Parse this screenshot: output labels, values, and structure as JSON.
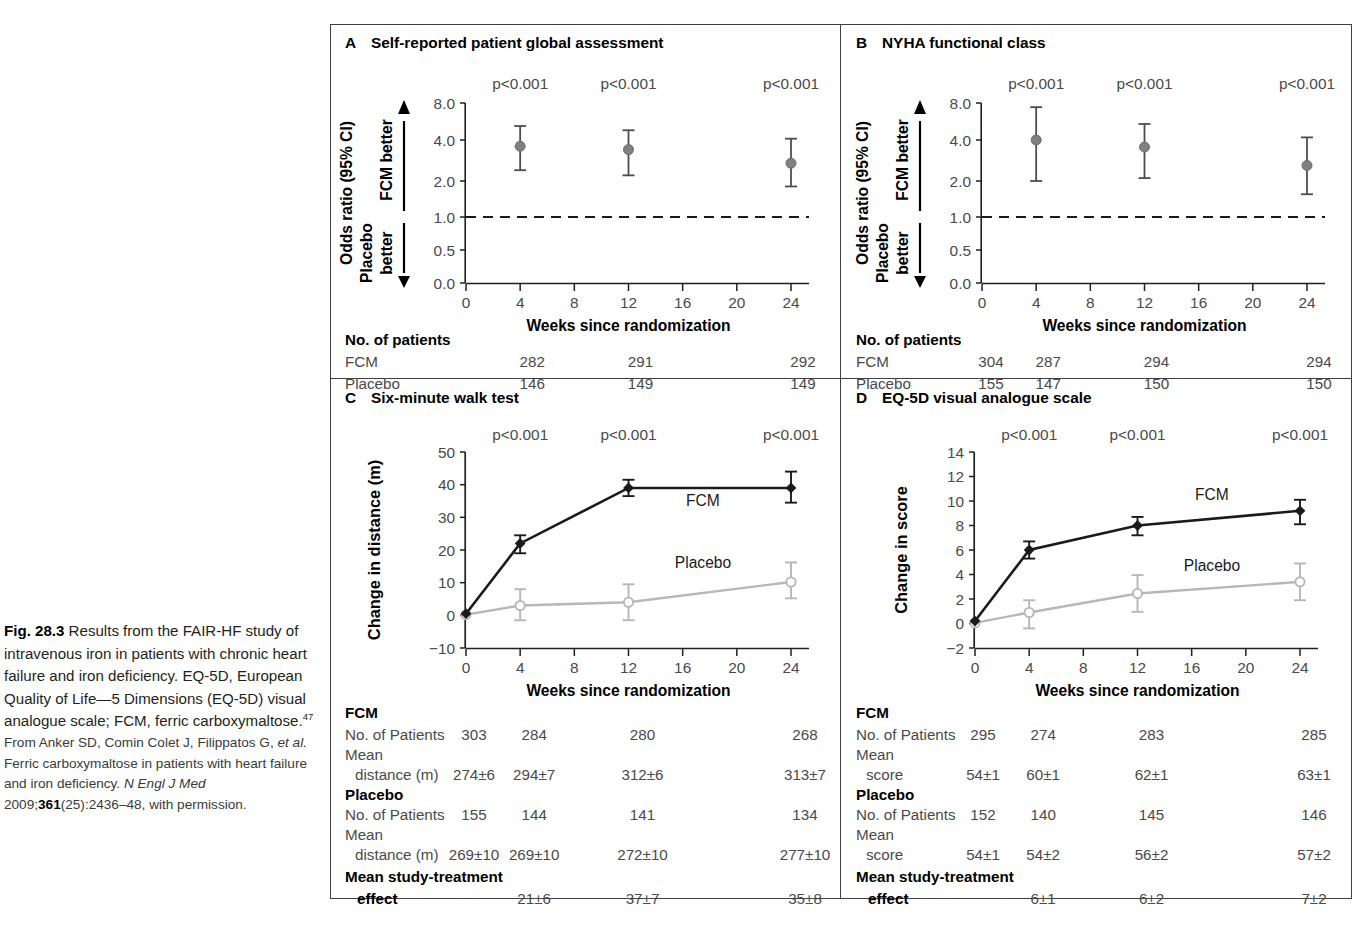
{
  "caption": {
    "fig_label": "Fig. 28.3",
    "lead": " Results from the FAIR-HF study of intravenous iron in patients with chronic heart failure and iron deficiency. EQ-5D, European Quality of Life—5 Dimensions (EQ-5D) visual analogue scale; FCM, ferric carboxymaltose.",
    "lead_sup": "47",
    "source_1": "From Anker SD, Comin Colet J, Filippatos G, ",
    "source_em1": "et al.",
    "source_2": " Ferric carboxymaltose in patients with heart failure and iron deficiency. ",
    "source_em2": "N Engl J Med",
    "source_3": " 2009;",
    "source_vol": "361",
    "source_4": "(25):2436–48, with permission."
  },
  "colors": {
    "fcm": "#1a1a1a",
    "placebo": "#b7b7b7",
    "marker_gray": "#808080",
    "axis": "#231f20",
    "text_gray": "#4a4a4a",
    "frame": "#3f3f3f"
  },
  "common": {
    "xlabel": "Weeks since randomization",
    "xticks": [
      0,
      4,
      8,
      12,
      16,
      20,
      24
    ],
    "pvalue": "p<0.001",
    "fcm_label": "FCM",
    "placebo_label": "Placebo"
  },
  "chart_data": [
    {
      "panel": "A",
      "letter": "A",
      "title": "Self-reported patient global assessment",
      "type": "scatter",
      "ylabel": "Odds ratio (95% CI)",
      "ylabel_up": "FCM better",
      "ylabel_down_1": "Placebo",
      "ylabel_down_2": "better",
      "xlabel": "Weeks since randomization",
      "yticks": [
        "8.0",
        "4.0",
        "2.0",
        "1.0",
        "0.5",
        "0.0"
      ],
      "ytick_vals": [
        8.0,
        4.0,
        2.0,
        1.0,
        0.5,
        0.0
      ],
      "xticks": [
        0,
        4,
        8,
        12,
        16,
        20,
        24
      ],
      "reference_line": 1.0,
      "x": [
        4,
        12,
        24
      ],
      "odds_ratio": [
        3.6,
        3.4,
        2.7
      ],
      "ci_low": [
        2.4,
        2.2,
        1.8
      ],
      "ci_high": [
        5.2,
        4.8,
        4.1
      ],
      "annotations": [
        "p<0.001",
        "p<0.001",
        "p<0.001"
      ],
      "table": {
        "header": "No. of patients",
        "rows": [
          {
            "label": "FCM",
            "values": [
              "",
              "282",
              "291",
              "",
              "292"
            ]
          },
          {
            "label": "Placebo",
            "values": [
              "",
              "146",
              "149",
              "",
              "149"
            ]
          }
        ]
      }
    },
    {
      "panel": "B",
      "letter": "B",
      "title": "NYHA functional class",
      "type": "scatter",
      "ylabel": "Odds ratio (95% CI)",
      "ylabel_up": "FCM better",
      "ylabel_down_1": "Placebo",
      "ylabel_down_2": "better",
      "xlabel": "Weeks since randomization",
      "yticks": [
        "8.0",
        "4.0",
        "2.0",
        "1.0",
        "0.5",
        "0.0"
      ],
      "ytick_vals": [
        8.0,
        4.0,
        2.0,
        1.0,
        0.5,
        0.0
      ],
      "xticks": [
        0,
        4,
        8,
        12,
        16,
        20,
        24
      ],
      "reference_line": 1.0,
      "x": [
        4,
        12,
        24
      ],
      "odds_ratio": [
        4.0,
        3.55,
        2.6
      ],
      "ci_low": [
        2.0,
        2.1,
        1.55
      ],
      "ci_high": [
        7.4,
        5.4,
        4.2
      ],
      "annotations": [
        "p<0.001",
        "p<0.001",
        "p<0.001"
      ],
      "table": {
        "header": "No. of patients",
        "rows": [
          {
            "label": "FCM",
            "values": [
              "304",
              "287",
              "294",
              "",
              "294"
            ]
          },
          {
            "label": "Placebo",
            "values": [
              "155",
              "147",
              "150",
              "",
              "150"
            ]
          }
        ]
      }
    },
    {
      "panel": "C",
      "letter": "C",
      "title": "Six-minute walk test",
      "type": "line",
      "ylabel": "Change in distance (m)",
      "xlabel": "Weeks since randomization",
      "yticks": [
        "50",
        "40",
        "30",
        "20",
        "10",
        "0",
        "−10"
      ],
      "ytick_vals": [
        50,
        40,
        30,
        20,
        10,
        0,
        -10
      ],
      "ylim": [
        -10,
        50
      ],
      "xticks": [
        0,
        4,
        8,
        12,
        16,
        20,
        24
      ],
      "x": [
        0,
        4,
        12,
        24
      ],
      "series": [
        {
          "name": "FCM",
          "values": [
            0.5,
            22,
            39,
            39
          ],
          "err_low": [
            0.5,
            3,
            2.5,
            4.5
          ],
          "err_high": [
            0.5,
            2.5,
            2.5,
            5
          ]
        },
        {
          "name": "Placebo",
          "values": [
            0.2,
            3,
            4,
            10.2
          ],
          "err_low": [
            0.2,
            4.5,
            5.5,
            5
          ],
          "err_high": [
            0.2,
            5,
            5.5,
            6
          ]
        }
      ],
      "annotations": [
        "p<0.001",
        "p<0.001",
        "p<0.001"
      ],
      "annotation_x": [
        4,
        12,
        24
      ],
      "table": {
        "group_fcm": "FCM",
        "group_placebo": "Placebo",
        "rows": [
          {
            "label": "No. of Patients",
            "indent": 0,
            "values": [
              "303",
              "284",
              "280",
              "",
              "268"
            ]
          },
          {
            "label": "Mean",
            "label2": "distance (m)",
            "indent": 1,
            "values": [
              "274±6",
              "294±7",
              "312±6",
              "",
              "313±7"
            ]
          },
          {
            "label": "No. of Patients",
            "indent": 0,
            "values": [
              "155",
              "144",
              "141",
              "",
              "134"
            ]
          },
          {
            "label": "Mean",
            "label2": "distance (m)",
            "indent": 1,
            "values": [
              "269±10",
              "269±10",
              "272±10",
              "",
              "277±10"
            ]
          }
        ],
        "effect_label_1": "Mean study-treatment",
        "effect_label_2": "effect",
        "effect_values": [
          "",
          "21±6",
          "37±7",
          "",
          "35±8"
        ]
      }
    },
    {
      "panel": "D",
      "letter": "D",
      "title": "EQ-5D visual analogue scale",
      "type": "line",
      "ylabel": "Change in score",
      "xlabel": "Weeks since randomization",
      "yticks": [
        "14",
        "12",
        "10",
        "8",
        "6",
        "4",
        "2",
        "0",
        "−2"
      ],
      "ytick_vals": [
        14,
        12,
        10,
        8,
        6,
        4,
        2,
        0,
        -2
      ],
      "ylim": [
        -2,
        14
      ],
      "xticks": [
        0,
        4,
        8,
        12,
        16,
        20,
        24
      ],
      "x": [
        0,
        4,
        12,
        24
      ],
      "series": [
        {
          "name": "FCM",
          "values": [
            0.2,
            6.0,
            8.0,
            9.2
          ],
          "err_low": [
            0.2,
            0.7,
            0.8,
            1.1
          ],
          "err_high": [
            0.2,
            0.7,
            0.7,
            0.9
          ]
        },
        {
          "name": "Placebo",
          "values": [
            0.05,
            0.9,
            2.45,
            3.4
          ],
          "err_low": [
            0.05,
            1.3,
            1.5,
            1.5
          ],
          "err_high": [
            0.05,
            1.0,
            1.5,
            1.5
          ]
        }
      ],
      "annotations": [
        "p<0.001",
        "p<0.001",
        "p<0.001"
      ],
      "annotation_x": [
        4,
        12,
        24
      ],
      "table": {
        "group_fcm": "FCM",
        "group_placebo": "Placebo",
        "rows": [
          {
            "label": "No. of Patients",
            "indent": 0,
            "values": [
              "295",
              "274",
              "283",
              "",
              "285"
            ]
          },
          {
            "label": "Mean",
            "label2": "score",
            "indent": 1,
            "values": [
              "54±1",
              "60±1",
              "62±1",
              "",
              "63±1"
            ]
          },
          {
            "label": "No. of Patients",
            "indent": 0,
            "values": [
              "152",
              "140",
              "145",
              "",
              "146"
            ]
          },
          {
            "label": "Mean",
            "label2": "score",
            "indent": 1,
            "values": [
              "54±1",
              "54±2",
              "56±2",
              "",
              "57±2"
            ]
          }
        ],
        "effect_label_1": "Mean study-treatment",
        "effect_label_2": "effect",
        "effect_values": [
          "",
          "6±1",
          "6±2",
          "",
          "7±2"
        ]
      }
    }
  ]
}
